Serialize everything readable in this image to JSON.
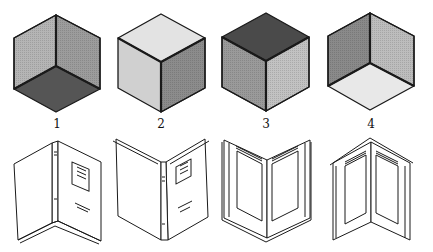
{
  "figure": {
    "cubes": [
      {
        "label": "1",
        "top": "#9a9a9a",
        "left": "#b5b5b5",
        "right": "#9c9c9c",
        "floor": "#555555",
        "view": "concave-corner-from-above"
      },
      {
        "label": "2",
        "top": "#e3e3e3",
        "left": "#d0d0d0",
        "right": "#8c8c8c",
        "view": "convex-cube-top-light"
      },
      {
        "label": "3",
        "top": "#4a4a4a",
        "left": "#9a9a9a",
        "right": "#c2c2c2",
        "view": "convex-cube-top-dark"
      },
      {
        "label": "4",
        "left": "#8a8a8a",
        "right": "#bdbdbd",
        "floor": "#e8e8e8",
        "view": "concave-corner-floor-light"
      }
    ],
    "books": [
      {
        "name": "book-open-outward-left",
        "view": "covers-facing-spine-back"
      },
      {
        "name": "book-open-outward-right",
        "view": "covers-facing-spine-front"
      },
      {
        "name": "book-open-inside-v",
        "view": "inside-pages-valley"
      },
      {
        "name": "book-open-inside-peak",
        "view": "inside-pages-ridge"
      }
    ],
    "colors": {
      "ink": "#1a1a1a",
      "background": "#ffffff"
    }
  }
}
